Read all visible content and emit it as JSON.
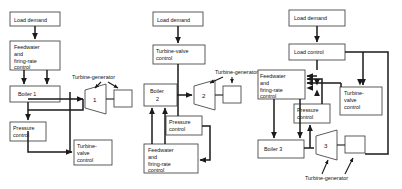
{
  "figure": {
    "type": "block-diagram"
  },
  "panels": [
    {
      "id": "boiler-following",
      "blocks": {
        "load_demand": "Load demand",
        "feedwater": [
          "Feedwater",
          "and",
          "firing-rate",
          "control"
        ],
        "boiler": "Boiler 1",
        "pressure": [
          "Pressure",
          "control"
        ],
        "turbine_valve": [
          "Turbine-",
          "valve",
          "control"
        ],
        "turbine_number": "1",
        "turbine_generator_label": "Turbine-generator"
      }
    },
    {
      "id": "turbine-following",
      "blocks": {
        "load_demand": "Load demand",
        "turbine_valve": [
          "Turbine-valve",
          "control"
        ],
        "boiler": [
          "Boiler",
          "2"
        ],
        "pressure": [
          "Pressure",
          "control"
        ],
        "feedwater": [
          "Feedwater",
          "and",
          "firing-rate",
          "control"
        ],
        "turbine_number": "2",
        "turbine_generator_label": "Turbine-generator"
      }
    },
    {
      "id": "coordinated",
      "blocks": {
        "load_demand": "Load  demand",
        "load_control": "Load  control",
        "feedwater": [
          "Feedwater",
          "and",
          "firing-rate",
          "control"
        ],
        "pressure": [
          "Pressure",
          "control"
        ],
        "turbine_valve": [
          "Turbine-",
          "valve",
          "control"
        ],
        "boiler": "Boiler 3",
        "turbine_number": "3",
        "turbine_generator_label": "Turbine-generator"
      }
    }
  ],
  "colors": {
    "box_stroke": "#4a4a4a",
    "line": "#1a1a1a",
    "background": "#ffffff",
    "text": "#111111"
  }
}
